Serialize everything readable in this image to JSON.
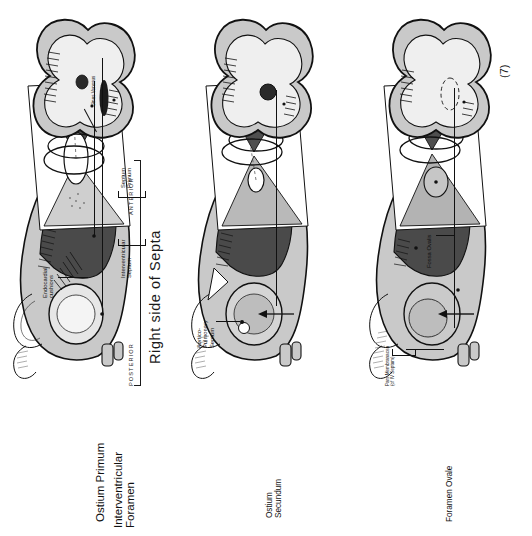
{
  "plate": {
    "title": "Right side of  Septa",
    "number": "(7)",
    "orientation": {
      "anterior": "ANTERIOR",
      "posterior": "POSTERIOR"
    }
  },
  "colors": {
    "paper": "#ffffff",
    "ink": "#111111",
    "myocardium_light": "#c9c9c9",
    "myocardium_mid": "#9a9a9a",
    "lumen_dark": "#4a4a4a",
    "lumen_darker": "#3a3a3a",
    "septum_pale": "#d8d8d8",
    "wedge_dark": "#4f4f4f",
    "wedge_light": "#bdbdbd"
  },
  "rows": [
    {
      "id": "row-1",
      "stage_label": "Ostium Primum",
      "labels": [
        {
          "id": "ostium-primum",
          "text": "Ostium Primum",
          "size": "big"
        },
        {
          "id": "sinus-venosus",
          "text": "Sinus Venosus",
          "size": "tiny"
        },
        {
          "id": "interventricular-foramen",
          "text": "Interventricular\nForamen",
          "size": "big"
        },
        {
          "id": "septum-primum",
          "text": "Septum\nPrimum",
          "size": "small"
        },
        {
          "id": "interventricular-septum",
          "text": "Interventricular\nSeptum",
          "size": "small"
        },
        {
          "id": "endocardial-cushions",
          "text": "Endocardial\ncushions",
          "size": "small"
        }
      ]
    },
    {
      "id": "row-2",
      "stage_label": "Ostium Secundum",
      "labels": [
        {
          "id": "ostium-secundum",
          "text": "Ostium\nSecundum",
          "size": "mid"
        },
        {
          "id": "aortico-pulmonary-septum",
          "text": "Aortico-\nPulmonary\nSeptum",
          "size": "small"
        }
      ]
    },
    {
      "id": "row-3",
      "stage_label": "Foramen Ovale",
      "labels": [
        {
          "id": "foramen-ovale",
          "text": "Foramen Ovale",
          "size": "mid"
        },
        {
          "id": "fossa-ovalis",
          "text": "Fossa Ovalis",
          "size": "small"
        },
        {
          "id": "pars-membranacea",
          "text": "Pars Membranacea\n(of IV Septum)",
          "size": "tiny"
        }
      ]
    }
  ],
  "figure_parts": {
    "frontal_view": "frontal-heart-view",
    "septa_diagram": "three-dimensional-septa-diagram",
    "sagittal_view": "sagittal-heart-section"
  }
}
